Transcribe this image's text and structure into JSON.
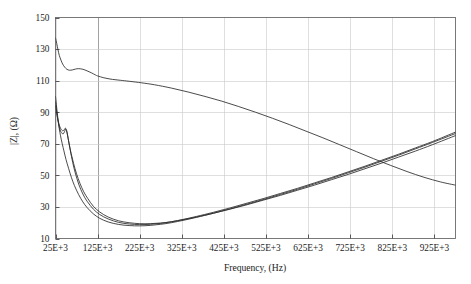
{
  "chart_data": {
    "type": "line",
    "title": "",
    "xlabel": "Frequency, (Hz)",
    "ylabel": "|Z|, (Ω)",
    "xlim": [
      25000,
      975000
    ],
    "ylim": [
      10,
      150
    ],
    "xticklabels": [
      "25E+3",
      "125E+3",
      "225E+3",
      "325E+3",
      "425E+3",
      "525E+3",
      "625E+3",
      "725E+3",
      "825E+3",
      "925E+3"
    ],
    "xtickvalues": [
      25000,
      125000,
      225000,
      325000,
      425000,
      525000,
      625000,
      725000,
      825000,
      925000
    ],
    "yticklabels": [
      "10",
      "30",
      "50",
      "70",
      "90",
      "110",
      "130",
      "150"
    ],
    "ytickvalues": [
      10,
      30,
      50,
      70,
      90,
      110,
      130,
      150
    ],
    "grid": true,
    "legend": "none",
    "line_color": "#2a2a2a",
    "series": [
      {
        "name": "curve-upper-descending",
        "x": [
          25000,
          28000,
          31000,
          34000,
          38000,
          42000,
          47000,
          52000,
          58000,
          65000,
          72000,
          80000,
          90000,
          100000,
          110000,
          120000,
          125000,
          140000,
          160000,
          180000,
          200000,
          230000,
          260000,
          300000,
          340000,
          380000,
          420000,
          460000,
          500000,
          540000,
          580000,
          620000,
          660000,
          700000,
          740000,
          780000,
          820000,
          860000,
          900000,
          940000,
          975000
        ],
        "y": [
          137.0,
          133.5,
          129.5,
          126.0,
          123.0,
          120.5,
          118.5,
          117.2,
          116.6,
          116.8,
          117.3,
          117.6,
          117.2,
          116.2,
          115.0,
          113.6,
          113.0,
          111.8,
          110.8,
          110.2,
          109.6,
          108.6,
          107.4,
          105.3,
          102.8,
          100.0,
          97.0,
          93.6,
          90.0,
          86.2,
          82.2,
          78.0,
          73.8,
          69.4,
          65.0,
          60.6,
          56.4,
          52.4,
          48.8,
          45.8,
          43.8
        ]
      },
      {
        "name": "curve-a-lower",
        "x": [
          25000,
          27000,
          29000,
          31000,
          34000,
          37000,
          41000,
          45000,
          50000,
          56000,
          63000,
          70000,
          80000,
          90000,
          100000,
          115000,
          130000,
          150000,
          175000,
          200000,
          225000,
          250000,
          275000,
          300000,
          330000,
          360000,
          400000,
          440000,
          480000,
          520000,
          560000,
          600000,
          640000,
          680000,
          720000,
          760000,
          800000,
          840000,
          880000,
          920000,
          975000
        ],
        "y": [
          100.0,
          95.0,
          90.0,
          85.5,
          79.5,
          75.0,
          70.0,
          65.5,
          60.0,
          54.5,
          48.5,
          43.5,
          37.8,
          33.2,
          29.6,
          25.6,
          22.8,
          20.5,
          18.9,
          18.2,
          18.0,
          18.3,
          19.0,
          20.0,
          21.6,
          23.4,
          26.0,
          28.8,
          31.8,
          34.8,
          38.0,
          41.2,
          44.6,
          48.0,
          51.6,
          55.2,
          59.0,
          62.8,
          66.8,
          70.8,
          76.5
        ]
      },
      {
        "name": "curve-b-lower",
        "x": [
          25000,
          27000,
          29000,
          31000,
          34000,
          37000,
          40000,
          43000,
          46000,
          49000,
          52000,
          56000,
          60000,
          66000,
          72000,
          80000,
          90000,
          100000,
          115000,
          130000,
          150000,
          175000,
          200000,
          225000,
          250000,
          275000,
          300000,
          330000,
          360000,
          400000,
          440000,
          480000,
          520000,
          560000,
          600000,
          640000,
          680000,
          720000,
          760000,
          800000,
          840000,
          880000,
          920000,
          975000
        ],
        "y": [
          96.5,
          92.0,
          88.0,
          84.5,
          80.5,
          78.0,
          76.8,
          76.2,
          77.4,
          79.2,
          78.0,
          72.0,
          66.0,
          58.0,
          51.5,
          44.5,
          38.2,
          33.6,
          28.6,
          25.2,
          22.4,
          20.2,
          19.2,
          18.8,
          19.0,
          19.6,
          20.6,
          22.2,
          24.0,
          26.6,
          29.4,
          32.4,
          35.4,
          38.6,
          41.8,
          45.2,
          48.6,
          52.2,
          55.8,
          59.6,
          63.4,
          67.4,
          71.4,
          77.4
        ]
      },
      {
        "name": "curve-c-lower",
        "x": [
          25000,
          27000,
          29000,
          31000,
          34000,
          37000,
          40000,
          43000,
          46000,
          49000,
          53000,
          57000,
          62000,
          68000,
          75000,
          83000,
          92000,
          102000,
          115000,
          130000,
          150000,
          175000,
          200000,
          225000,
          250000,
          275000,
          300000,
          330000,
          360000,
          400000,
          440000,
          480000,
          520000,
          560000,
          600000,
          640000,
          680000,
          720000,
          760000,
          800000,
          840000,
          880000,
          920000,
          975000
        ],
        "y": [
          94.0,
          90.5,
          87.5,
          85.0,
          81.8,
          79.8,
          78.6,
          78.2,
          79.0,
          79.8,
          76.0,
          70.5,
          64.0,
          57.5,
          51.0,
          45.0,
          39.6,
          35.2,
          30.4,
          26.8,
          23.6,
          21.2,
          20.0,
          19.4,
          19.4,
          19.8,
          20.6,
          22.0,
          23.6,
          26.0,
          28.6,
          31.4,
          34.4,
          37.4,
          40.6,
          43.8,
          47.2,
          50.6,
          54.2,
          57.8,
          61.6,
          65.4,
          69.4,
          75.2
        ]
      }
    ]
  },
  "axes": {
    "x_title": "Frequency, (Hz)",
    "y_title": "|Z|, (Ω)"
  }
}
